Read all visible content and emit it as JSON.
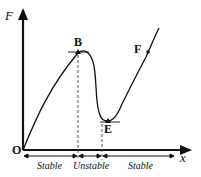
{
  "diagram": {
    "type": "force-displacement curve",
    "axes": {
      "y_label": "F",
      "x_label": "x",
      "origin_label": "O"
    },
    "points": [
      {
        "label": "B",
        "description": "local maximum"
      },
      {
        "label": "E",
        "description": "local minimum"
      },
      {
        "label": "F",
        "description": "point on rising branch"
      }
    ],
    "regions": [
      {
        "label": "Stable"
      },
      {
        "label": "Unstable"
      },
      {
        "label": "Stable"
      }
    ],
    "colors": {
      "line": "#111111",
      "background": "#ffffff"
    }
  }
}
